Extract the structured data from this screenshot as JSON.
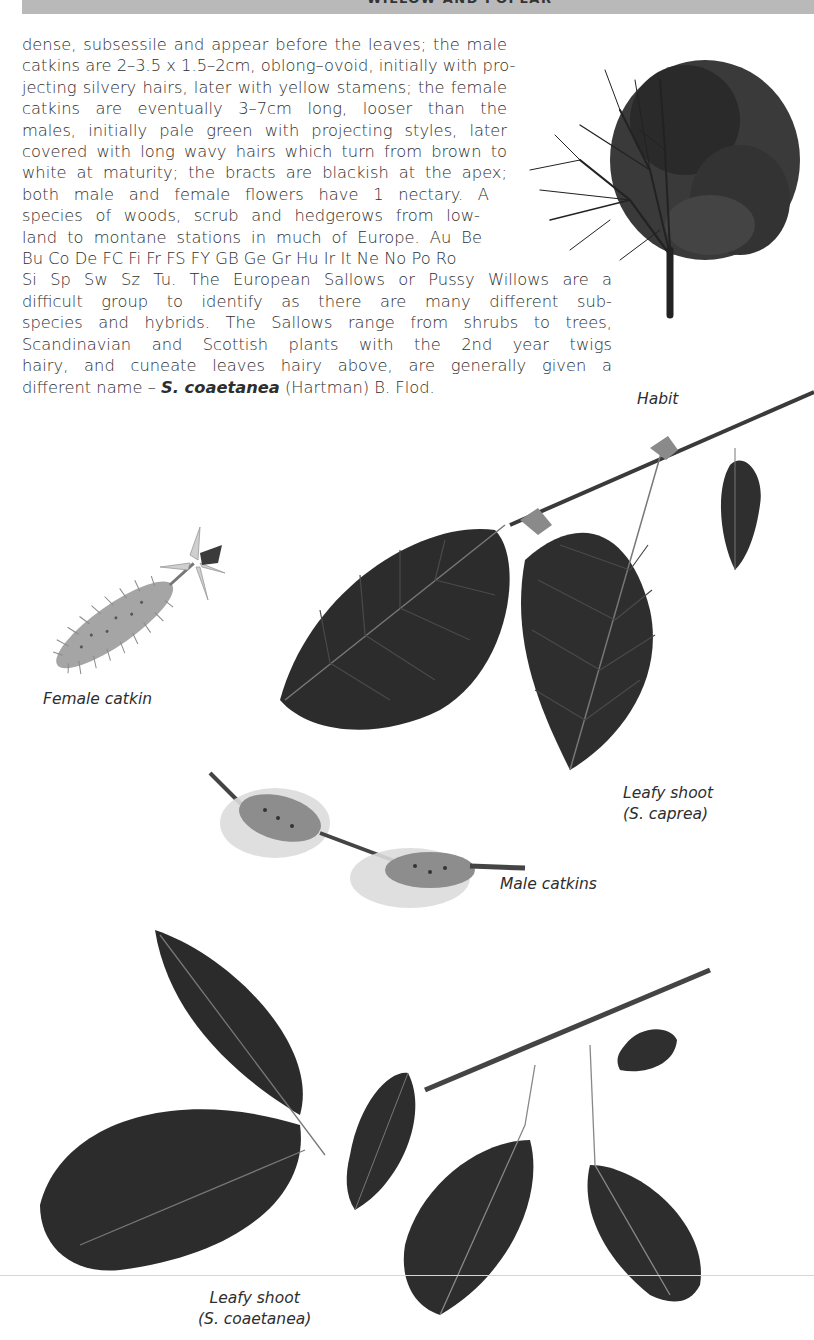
{
  "header": {
    "running_title": "WILLOW AND POPLAR"
  },
  "body": {
    "lines": [
      "dense, subsessile and appear before the leaves; the male",
      "catkins are 2–3.5 x 1.5–2cm, oblong–ovoid, initially with pro-",
      "jecting silvery hairs, later with yellow stamens; the female",
      "catkins are eventually 3–7cm long, looser than the",
      "males, initially pale green with projecting styles, later",
      "covered with long wavy hairs which turn from brown to",
      "white at maturity; the bracts are blackish at the apex;",
      "both male and female flowers have 1 nectary. A",
      "species of woods, scrub and hedgerows from low-",
      "land to montane stations in much of Europe. Au Be",
      "Bu Co De FC Fi Fr FS FY GB Ge Gr Hu Ir It Ne No Po Ro",
      "Si Sp Sw Sz Tu. The European Sallows or Pussy Willows are a",
      "difficult group to identify as there are many different sub-",
      "species and hybrids. The Sallows range from shrubs to trees,",
      "Scandinavian and Scottish plants with the 2nd year twigs",
      "hairy, and cuneate leaves hairy above, are generally given a"
    ],
    "last_line_prefix": "different name – ",
    "last_line_species": "S. coaetanea",
    "last_line_suffix": " (Hartman) B. Flod."
  },
  "illustrations": [
    {
      "id": "habit",
      "caption": "Habit",
      "icon": "tree-habit-icon"
    },
    {
      "id": "female-catkin",
      "caption": "Female catkin",
      "icon": "female-catkin-icon"
    },
    {
      "id": "leafy-shoot-caprea",
      "caption_line1": "Leafy shoot",
      "caption_line2": "(S. caprea)",
      "icon": "leafy-shoot-icon"
    },
    {
      "id": "male-catkins",
      "caption": "Male catkins",
      "icon": "male-catkins-icon"
    },
    {
      "id": "leafy-shoot-coaetanea",
      "caption_line1": "Leafy shoot",
      "caption_line2": "(S. coaetanea)",
      "icon": "leafy-shoot-icon"
    }
  ],
  "colors": {
    "header_band": "#b9b9b9",
    "text": "#2e2e2e",
    "leaf_dark": "#2a2a2a",
    "leaf_mid": "#4a4a4a",
    "catkin_grey": "#a9a9a9"
  }
}
